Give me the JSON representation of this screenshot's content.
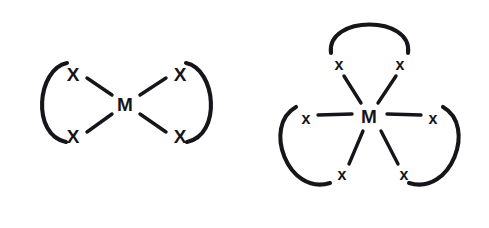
{
  "figure": {
    "name": "chelate-complex-diagrams",
    "background_color": "#ffffff",
    "stroke_color": "#16161a",
    "width": 489,
    "height": 228
  },
  "structures": [
    {
      "id": "bidentate-bis-chelate",
      "name": "square-planar-bis-bidentate-complex",
      "metal": {
        "label": "M",
        "x": 125,
        "y": 104
      },
      "donors": [
        {
          "label": "X",
          "x": 73,
          "y": 74,
          "size": "lg",
          "id": "donor-top-left"
        },
        {
          "label": "X",
          "x": 73,
          "y": 136,
          "size": "lg",
          "id": "donor-bottom-left"
        },
        {
          "label": "X",
          "x": 180,
          "y": 74,
          "size": "lg",
          "id": "donor-top-right"
        },
        {
          "label": "X",
          "x": 180,
          "y": 136,
          "size": "lg",
          "id": "donor-bottom-right"
        }
      ],
      "bonds": [
        {
          "id": "bond-metal-top-left",
          "x1": 87,
          "y1": 78,
          "x2": 112,
          "y2": 95
        },
        {
          "id": "bond-metal-bottom-left",
          "x1": 87,
          "y1": 132,
          "x2": 112,
          "y2": 114
        },
        {
          "id": "bond-metal-top-right",
          "x1": 166,
          "y1": 78,
          "x2": 140,
          "y2": 95
        },
        {
          "id": "bond-metal-bottom-right",
          "x1": 166,
          "y1": 132,
          "x2": 140,
          "y2": 114
        }
      ],
      "backbones": [
        {
          "id": "backbone-left",
          "d": "M 67 63 C 37 69, 31 135, 66 142"
        },
        {
          "id": "backbone-right",
          "d": "M 186 63 C 216 69, 222 135, 187 142"
        }
      ]
    },
    {
      "id": "tridentate-tris-chelate",
      "name": "octahedral-tris-bidentate-complex",
      "metal": {
        "label": "M",
        "x": 369,
        "y": 116
      },
      "donors": [
        {
          "label": "x",
          "x": 339,
          "y": 64,
          "size": "sm",
          "id": "donor-top-left"
        },
        {
          "label": "x",
          "x": 400,
          "y": 64,
          "size": "sm",
          "id": "donor-top-right"
        },
        {
          "label": "x",
          "x": 306,
          "y": 118,
          "size": "sm",
          "id": "donor-mid-left"
        },
        {
          "label": "x",
          "x": 433,
          "y": 118,
          "size": "sm",
          "id": "donor-mid-right"
        },
        {
          "label": "x",
          "x": 342,
          "y": 174,
          "size": "sm",
          "id": "donor-bottom-left"
        },
        {
          "label": "x",
          "x": 404,
          "y": 174,
          "size": "sm",
          "id": "donor-bottom-right"
        }
      ],
      "bonds": [
        {
          "id": "bond-metal-top-left",
          "x1": 344,
          "y1": 76,
          "x2": 361,
          "y2": 103
        },
        {
          "id": "bond-metal-top-right",
          "x1": 396,
          "y1": 76,
          "x2": 378,
          "y2": 103
        },
        {
          "id": "bond-metal-mid-left",
          "x1": 318,
          "y1": 115,
          "x2": 352,
          "y2": 114
        },
        {
          "id": "bond-metal-mid-right",
          "x1": 421,
          "y1": 115,
          "x2": 387,
          "y2": 114
        },
        {
          "id": "bond-metal-bottom-left",
          "x1": 349,
          "y1": 164,
          "x2": 363,
          "y2": 131
        },
        {
          "id": "bond-metal-bottom-right",
          "x1": 398,
          "y1": 164,
          "x2": 381,
          "y2": 131
        }
      ],
      "backbones": [
        {
          "id": "backbone-top",
          "d": "M 331 53 C 326 15, 413 15, 408 53"
        },
        {
          "id": "backbone-lower-left",
          "d": "M 296 107 C 262 126, 288 196, 330 183"
        },
        {
          "id": "backbone-lower-right",
          "d": "M 443 107 C 477 126, 451 196, 409 183"
        }
      ]
    }
  ]
}
